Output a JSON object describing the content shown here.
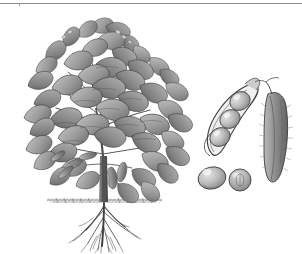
{
  "figure": {
    "title": "Soybean plant botanical engraving",
    "subject": "soybean",
    "style": "grayscale engraving",
    "background_color": "#ffffff",
    "ink_color": "#4a4a4a",
    "width_px": 302,
    "height_px": 254
  },
  "top_rule": {
    "name": "horizontal-rule",
    "color": "#8d8d8d",
    "tick_color": "#a7a7a7"
  },
  "specimens": {
    "whole_plant": {
      "label": "whole soybean plant",
      "parts": {
        "foliage": "trifoliate leaf canopy",
        "stem": "central erect stem",
        "pods": "immature pods on lower stem",
        "soil_line": "ground surface hatching",
        "roots": "branching taproot system"
      },
      "bounds": {
        "x": 18,
        "y": 15,
        "width": 172,
        "height": 235
      }
    },
    "open_pod": {
      "label": "open pod with three seeds",
      "seed_count": 3,
      "bounds": {
        "x": 205,
        "y": 78,
        "width": 58,
        "height": 82
      }
    },
    "closed_pod": {
      "label": "closed pubescent pod",
      "bounds": {
        "x": 255,
        "y": 76,
        "width": 40,
        "height": 102
      }
    },
    "loose_seeds": {
      "label": "two loose soybean seeds",
      "seed_count": 2,
      "bounds": {
        "x": 198,
        "y": 158,
        "width": 62,
        "height": 34
      }
    }
  },
  "palette": {
    "paper": "#ffffff",
    "leaf_light": "#c9c9c9",
    "leaf_mid": "#9b9b9b",
    "leaf_dark": "#6e6e6e",
    "leaf_darkest": "#4b4b4b",
    "outline": "#3c3c3c",
    "seed_light": "#d8d8d8",
    "seed_mid": "#b0b0b0",
    "seed_shadow": "#7d7d7d",
    "soil": "#6b6b6b",
    "root": "#3f3f3f",
    "rule": "#8d8d8d"
  }
}
